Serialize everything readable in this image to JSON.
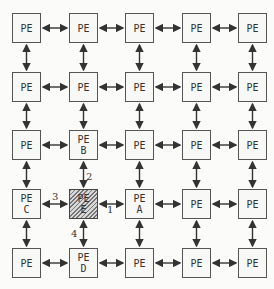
{
  "diagram": {
    "type": "mesh-of-processing-elements",
    "rows": 5,
    "cols": 5,
    "node_label": "PE",
    "grid": [
      [
        {
          "label": "PE",
          "sub": ""
        },
        {
          "label": "PE",
          "sub": ""
        },
        {
          "label": "PE",
          "sub": ""
        },
        {
          "label": "PE",
          "sub": ""
        },
        {
          "label": "PE",
          "sub": ""
        }
      ],
      [
        {
          "label": "PE",
          "sub": ""
        },
        {
          "label": "PE",
          "sub": ""
        },
        {
          "label": "PE",
          "sub": ""
        },
        {
          "label": "PE",
          "sub": ""
        },
        {
          "label": "PE",
          "sub": ""
        }
      ],
      [
        {
          "label": "PE",
          "sub": ""
        },
        {
          "label": "PE",
          "sub": "B"
        },
        {
          "label": "PE",
          "sub": ""
        },
        {
          "label": "PE",
          "sub": ""
        },
        {
          "label": "PE",
          "sub": ""
        }
      ],
      [
        {
          "label": "PE",
          "sub": "C"
        },
        {
          "label": "PE",
          "sub": "E",
          "hatched": true
        },
        {
          "label": "PE",
          "sub": "A"
        },
        {
          "label": "PE",
          "sub": ""
        },
        {
          "label": "PE",
          "sub": ""
        }
      ],
      [
        {
          "label": "PE",
          "sub": ""
        },
        {
          "label": "PE",
          "sub": "D"
        },
        {
          "label": "PE",
          "sub": ""
        },
        {
          "label": "PE",
          "sub": ""
        },
        {
          "label": "PE",
          "sub": ""
        }
      ]
    ],
    "link_labels": {
      "east": "1",
      "north": "2",
      "west": "3",
      "south": "4"
    },
    "connections": "bidirectional arrows between all horizontally and vertically adjacent PEs"
  }
}
